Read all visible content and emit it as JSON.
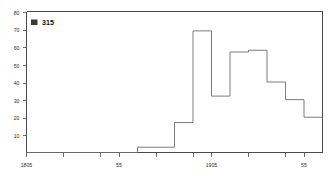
{
  "legend": {
    "label": "315",
    "marker_name": "legend-marker-swatch",
    "marker_color": "#3a3a3a"
  },
  "axes": {
    "y_ticks": [
      "10",
      "20",
      "30",
      "40",
      "50",
      "60",
      "70",
      "80"
    ],
    "x_ticks": [
      "1805",
      "55",
      "1905",
      "55"
    ],
    "axis_color": "#4a4a4a"
  },
  "chart_data": {
    "type": "line",
    "title": "",
    "subtitle": "",
    "xlabel": "",
    "ylabel": "",
    "style": "step-post",
    "grid": false,
    "legend_position": "top-left",
    "series_color": "#6d6d6d",
    "xlim": [
      1805,
      1965
    ],
    "ylim": [
      0,
      80
    ],
    "x_tick_values": [
      1805,
      1855,
      1905,
      1955
    ],
    "x_tick_labels": [
      "1805",
      "55",
      "1905",
      "55"
    ],
    "y_tick_values": [
      10,
      20,
      30,
      40,
      50,
      60,
      70,
      80
    ],
    "y_tick_labels": [
      "10",
      "20",
      "30",
      "40",
      "50",
      "60",
      "70",
      "80"
    ],
    "categories": [
      "1805",
      "1815",
      "1825",
      "1835",
      "1845",
      "1855",
      "1865",
      "1875",
      "1885",
      "1895",
      "1905",
      "1915",
      "1925",
      "1935",
      "1945",
      "1955"
    ],
    "series": [
      {
        "name": "315",
        "values": [
          0,
          0,
          0,
          0,
          0,
          0,
          3,
          3,
          17,
          69,
          32,
          57,
          58,
          40,
          30,
          20
        ]
      }
    ],
    "annotations": [
      "315"
    ]
  }
}
